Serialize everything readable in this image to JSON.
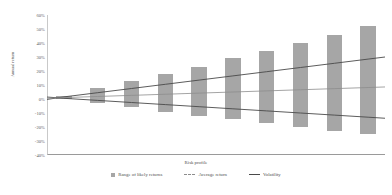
{
  "chart_data": {
    "type": "bar",
    "title": "",
    "xlabel": "Risk profile",
    "ylabel": "Annual return",
    "ylim": [
      -40,
      60
    ],
    "ytick_labels": [
      "60%",
      "50%",
      "40%",
      "30%",
      "20%",
      "10%",
      "0%",
      "-10%",
      "-20%",
      "-30%",
      "-40%"
    ],
    "ytick_values": [
      60,
      50,
      40,
      30,
      20,
      10,
      0,
      -10,
      -20,
      -30,
      -40
    ],
    "grid": false,
    "legend_position": "bottom",
    "categories": [
      "1",
      "2",
      "3",
      "4",
      "5",
      "6",
      "7",
      "8",
      "9",
      "10"
    ],
    "series": [
      {
        "name": "Range of likely returns",
        "type": "bar",
        "upper": [
          2,
          8,
          13,
          18,
          23,
          29,
          34,
          40,
          46,
          52
        ],
        "lower": [
          0,
          -3,
          -6,
          -9,
          -12,
          -14,
          -17,
          -20,
          -23,
          -25
        ]
      },
      {
        "name": "Average return",
        "type": "line",
        "values": [
          1.0,
          1.8,
          2.6,
          3.4,
          4.2,
          5.0,
          5.8,
          6.6,
          7.4,
          8.2
        ]
      },
      {
        "name": "Volatility",
        "type": "line",
        "values": [
          1.5,
          4.5,
          7.5,
          10.5,
          13.5,
          16.5,
          19.5,
          22.5,
          25.5,
          28.5
        ]
      },
      {
        "name": "Volatility lower",
        "type": "line",
        "values": [
          0.5,
          -1.0,
          -2.5,
          -4.0,
          -5.5,
          -7.0,
          -8.5,
          -10.0,
          -11.5,
          -13.0
        ]
      }
    ],
    "colors": {
      "bar": "#a6a6a6",
      "average_return_line": "#8d8d8d",
      "volatility_line": "#4a4a4a",
      "axis": "#9a9a9a",
      "text": "#4f4f4f"
    }
  },
  "legend": {
    "items": [
      {
        "label": "Range of likely returns",
        "marker": "square-swatch-icon"
      },
      {
        "label": "Average return",
        "marker": "dashed-line-icon"
      },
      {
        "label": "Volatility",
        "marker": "solid-line-icon"
      }
    ]
  }
}
